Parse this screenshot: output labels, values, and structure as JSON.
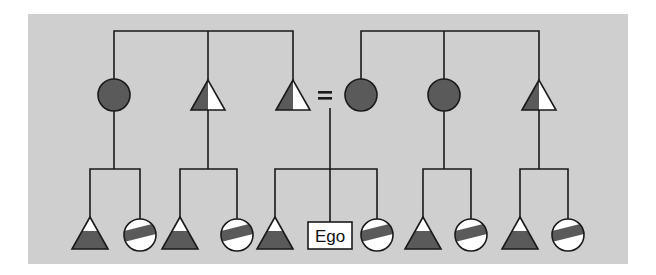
{
  "diagram": {
    "type": "kinship-chart",
    "colors": {
      "background": "#cfcfcf",
      "dark_fill": "#5a5a5a",
      "light_fill": "#ffffff",
      "line": "#1a1a1a"
    },
    "generation_1": {
      "left_sibling_set": [
        {
          "symbol": "circle",
          "sex": "female",
          "fill": "solid-dark"
        },
        {
          "symbol": "triangle",
          "sex": "male",
          "fill": "left-half-dark"
        },
        {
          "symbol": "triangle",
          "sex": "male",
          "fill": "left-half-dark",
          "married_to": "right_sibling_set.0"
        }
      ],
      "marriage_symbol": "=",
      "right_sibling_set": [
        {
          "symbol": "circle",
          "sex": "female",
          "fill": "solid-dark"
        },
        {
          "symbol": "circle",
          "sex": "female",
          "fill": "solid-dark"
        },
        {
          "symbol": "triangle",
          "sex": "male",
          "fill": "left-half-dark"
        }
      ]
    },
    "generation_2": {
      "groups": [
        {
          "parent": "left_sibling_set.0",
          "children": [
            {
              "symbol": "triangle",
              "fill": "bottom-dark"
            },
            {
              "symbol": "circle",
              "fill": "diagonal-band"
            }
          ]
        },
        {
          "parent": "left_sibling_set.1",
          "children": [
            {
              "symbol": "triangle",
              "fill": "bottom-dark"
            },
            {
              "symbol": "circle",
              "fill": "diagonal-band"
            }
          ]
        },
        {
          "parent": "marriage",
          "children": [
            {
              "symbol": "triangle",
              "fill": "bottom-dark"
            },
            {
              "symbol": "box",
              "label": "Ego"
            },
            {
              "symbol": "circle",
              "fill": "diagonal-band"
            }
          ]
        },
        {
          "parent": "right_sibling_set.1",
          "children": [
            {
              "symbol": "triangle",
              "fill": "bottom-dark"
            },
            {
              "symbol": "circle",
              "fill": "diagonal-band"
            }
          ]
        },
        {
          "parent": "right_sibling_set.2",
          "children": [
            {
              "symbol": "triangle",
              "fill": "bottom-dark"
            },
            {
              "symbol": "circle",
              "fill": "diagonal-band"
            }
          ]
        }
      ]
    },
    "labels": {
      "ego": "Ego",
      "equals": "="
    }
  }
}
